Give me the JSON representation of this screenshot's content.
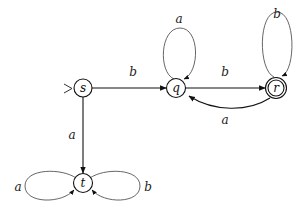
{
  "diagram": {
    "type": "finite-automaton",
    "colors": {
      "stroke": "#111111",
      "loop_stroke": "#555555",
      "background": "#ffffff"
    },
    "states": [
      {
        "id": "s",
        "label": "s",
        "initial": true,
        "accepting": false
      },
      {
        "id": "q",
        "label": "q",
        "initial": false,
        "accepting": false
      },
      {
        "id": "r",
        "label": "r",
        "initial": false,
        "accepting": true
      },
      {
        "id": "t",
        "label": "t",
        "initial": false,
        "accepting": false
      }
    ],
    "start_marker": ">",
    "transitions": [
      {
        "from": "s",
        "to": "q",
        "label": "b"
      },
      {
        "from": "s",
        "to": "t",
        "label": "a"
      },
      {
        "from": "q",
        "to": "q",
        "label": "a"
      },
      {
        "from": "q",
        "to": "r",
        "label": "b"
      },
      {
        "from": "r",
        "to": "r",
        "label": "b"
      },
      {
        "from": "r",
        "to": "q",
        "label": "a"
      },
      {
        "from": "t",
        "to": "t",
        "label": "a",
        "side": "left"
      },
      {
        "from": "t",
        "to": "t",
        "label": "b",
        "side": "right"
      }
    ]
  }
}
